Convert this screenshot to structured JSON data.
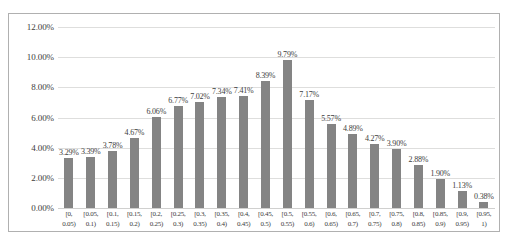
{
  "chart_data": {
    "type": "bar",
    "title": "",
    "xlabel": "",
    "ylabel": "",
    "ylim": [
      0,
      12
    ],
    "ytick_labels": [
      "12.00%",
      "10.00%",
      "8.00%",
      "6.00%",
      "4.00%",
      "2.00%",
      "0.00%"
    ],
    "ytick_values": [
      12,
      10,
      8,
      6,
      4,
      2,
      0
    ],
    "grid": true,
    "legend": false,
    "bar_color": "#848484",
    "gridline_color": "#dededd",
    "axis_text_color": "#3d3d3d",
    "border_color": "#b0b0b0",
    "categories": [
      "[0, 0.05)",
      "[0.05, 0.1)",
      "[0.1, 0.15)",
      "[0.15, 0.2)",
      "[0.2, 0.25)",
      "[0.25, 0.3)",
      "[0.3, 0.35)",
      "[0.35, 0.4)",
      "[0.4, 0.45)",
      "[0.45, 0.5)",
      "[0.5, 0.55)",
      "[0.55, 0.6)",
      "[0.6, 0.65)",
      "[0.65, 0.7)",
      "[0.7, 0.75)",
      "[0.75, 0.8)",
      "[0.8, 0.85)",
      "[0.85, 0.9)",
      "[0.9, 0.95)",
      "[0.95, 1)"
    ],
    "category_lines": [
      [
        "[0,",
        "0.05)"
      ],
      [
        "[0.05,",
        "0.1)"
      ],
      [
        "[0.1,",
        "0.15)"
      ],
      [
        "[0.15,",
        "0.2)"
      ],
      [
        "[0.2,",
        "0.25)"
      ],
      [
        "[0.25,",
        "0.3)"
      ],
      [
        "[0.3,",
        "0.35)"
      ],
      [
        "[0.35,",
        "0.4)"
      ],
      [
        "[0.4,",
        "0.45)"
      ],
      [
        "[0.45,",
        "0.5)"
      ],
      [
        "[0.5,",
        "0.55)"
      ],
      [
        "[0.55,",
        "0.6)"
      ],
      [
        "[0.6,",
        "0.65)"
      ],
      [
        "[0.65,",
        "0.7)"
      ],
      [
        "[0.7,",
        "0.75)"
      ],
      [
        "[0.75,",
        "0.8)"
      ],
      [
        "[0.8,",
        "0.85)"
      ],
      [
        "[0.85,",
        "0.9)"
      ],
      [
        "[0.9,",
        "0.95)"
      ],
      [
        "[0.95,",
        "1)"
      ]
    ],
    "values": [
      3.29,
      3.39,
      3.78,
      4.67,
      6.06,
      6.77,
      7.02,
      7.34,
      7.41,
      8.39,
      9.79,
      7.17,
      5.57,
      4.89,
      4.27,
      3.9,
      2.88,
      1.9,
      1.13,
      0.38
    ],
    "value_labels": [
      "3.29%",
      "3.39%",
      "3.78%",
      "4.67%",
      "6.06%",
      "6.77%",
      "7.02%",
      "7.34%",
      "7.41%",
      "8.39%",
      "9.79%",
      "7.17%",
      "5.57%",
      "4.89%",
      "4.27%",
      "3.90%",
      "2.88%",
      "1.90%",
      "1.13%",
      "0.38%"
    ]
  }
}
